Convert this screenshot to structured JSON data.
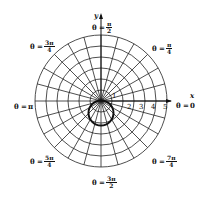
{
  "diagram": {
    "type": "polar-grid",
    "curve": "circle through origin below x-axis (r = -2 sin θ)",
    "axes": {
      "x_label": "x",
      "y_label": "y"
    },
    "radial_ticks": [
      "1",
      "2",
      "3",
      "4",
      "5"
    ],
    "angle_labels": [
      {
        "id": "zero",
        "prefix": "θ = ",
        "text": "0"
      },
      {
        "id": "pi-over-4",
        "prefix": "θ = ",
        "num": "π",
        "den": "4"
      },
      {
        "id": "pi-over-2",
        "prefix": "θ = ",
        "num": "π",
        "den": "2"
      },
      {
        "id": "3pi-over-4",
        "prefix": "θ = ",
        "num": "3π",
        "den": "4"
      },
      {
        "id": "pi",
        "prefix": "θ = ",
        "text": "π"
      },
      {
        "id": "5pi-over-4",
        "prefix": "θ = ",
        "num": "5π",
        "den": "4"
      },
      {
        "id": "3pi-over-2",
        "prefix": "θ = ",
        "num": "3π",
        "den": "2"
      },
      {
        "id": "7pi-over-4",
        "prefix": "θ = ",
        "num": "7π",
        "den": "4"
      }
    ],
    "colors": {
      "line": "#111111",
      "background": "#ffffff"
    }
  }
}
